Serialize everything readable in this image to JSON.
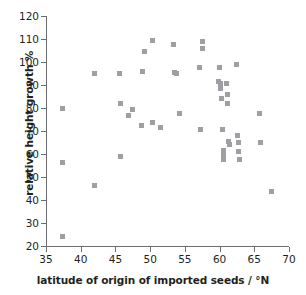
{
  "chart_data": {
    "type": "scatter",
    "title": "",
    "xlabel": "latitude of origin of imported seeds / °N",
    "ylabel": "relative height growth %",
    "xlim": [
      35,
      70
    ],
    "ylim": [
      20,
      120
    ],
    "xticks": [
      35,
      40,
      45,
      50,
      55,
      60,
      65,
      70
    ],
    "yticks": [
      20,
      30,
      40,
      50,
      60,
      70,
      80,
      90,
      100,
      110,
      120
    ],
    "grid": false,
    "legend": false,
    "marker": "square",
    "marker_color": "#9d9fa2",
    "axis_color": "#6d6e71",
    "series": [
      {
        "name": "relative height growth",
        "points": [
          [
            37.4,
            79.6
          ],
          [
            37.4,
            56.4
          ],
          [
            37.4,
            24.0
          ],
          [
            42.0,
            95.0
          ],
          [
            42.0,
            46.4
          ],
          [
            45.6,
            95.0
          ],
          [
            45.7,
            81.8
          ],
          [
            45.8,
            58.9
          ],
          [
            46.9,
            76.9
          ],
          [
            47.5,
            79.5
          ],
          [
            48.8,
            72.6
          ],
          [
            48.9,
            95.9
          ],
          [
            49.2,
            104.7
          ],
          [
            50.3,
            109.2
          ],
          [
            50.4,
            73.9
          ],
          [
            51.5,
            71.5
          ],
          [
            53.3,
            107.5
          ],
          [
            53.5,
            95.3
          ],
          [
            53.8,
            95.2
          ],
          [
            54.2,
            77.5
          ],
          [
            57.1,
            97.4
          ],
          [
            57.2,
            70.7
          ],
          [
            57.6,
            108.8
          ],
          [
            57.6,
            105.8
          ],
          [
            59.9,
            91.7
          ],
          [
            60.0,
            97.4
          ],
          [
            60.1,
            88.6
          ],
          [
            60.2,
            90.8
          ],
          [
            60.3,
            84.2
          ],
          [
            60.4,
            70.6
          ],
          [
            60.5,
            61.5
          ],
          [
            60.5,
            59.5
          ],
          [
            60.6,
            57.7
          ],
          [
            61.0,
            90.6
          ],
          [
            61.1,
            85.7
          ],
          [
            61.2,
            81.8
          ],
          [
            61.3,
            65.6
          ],
          [
            61.4,
            64.2
          ],
          [
            62.5,
            99.0
          ],
          [
            62.6,
            68.0
          ],
          [
            62.7,
            65.0
          ],
          [
            62.7,
            61.0
          ],
          [
            62.8,
            57.4
          ],
          [
            65.8,
            77.5
          ],
          [
            65.9,
            65.2
          ],
          [
            67.5,
            43.5
          ]
        ]
      }
    ]
  }
}
